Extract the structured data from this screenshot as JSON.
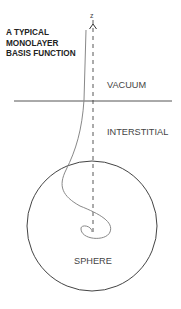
{
  "diagram": {
    "title_lines": [
      "A TYPICAL",
      "MONOLAYER",
      "BASIS FUNCTION"
    ],
    "axis_label": "z",
    "regions": {
      "vacuum": "VACUUM",
      "interstitial": "INTERSTITIAL",
      "sphere": "SPHERE"
    },
    "colors": {
      "line": "#555555",
      "curve": "#888888",
      "text": "#333333"
    }
  }
}
